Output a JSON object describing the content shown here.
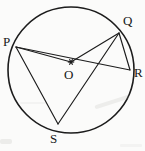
{
  "figure": {
    "type": "circle-geometry-diagram",
    "background_color": "#fbfbfa",
    "stroke_color": "#1c1c1c",
    "circle": {
      "cx": 71,
      "cy": 70,
      "r": 63
    },
    "center": {
      "name": "O",
      "x": 71,
      "y": 62,
      "label_x": 64,
      "label_y": 79
    },
    "points": [
      {
        "name": "P",
        "x": 16,
        "y": 47,
        "label_x": 3,
        "label_y": 46
      },
      {
        "name": "Q",
        "x": 119,
        "y": 33,
        "label_x": 123,
        "label_y": 25
      },
      {
        "name": "R",
        "x": 130,
        "y": 70,
        "label_x": 134,
        "label_y": 77
      },
      {
        "name": "S",
        "x": 58,
        "y": 124,
        "label_x": 50,
        "label_y": 143
      }
    ],
    "segments": [
      {
        "from": "P",
        "to": "S"
      },
      {
        "from": "P",
        "to": "R"
      },
      {
        "from": "P",
        "to": "O"
      },
      {
        "from": "Q",
        "to": "O"
      },
      {
        "from": "Q",
        "to": "R"
      },
      {
        "from": "Q",
        "to": "S"
      }
    ]
  }
}
